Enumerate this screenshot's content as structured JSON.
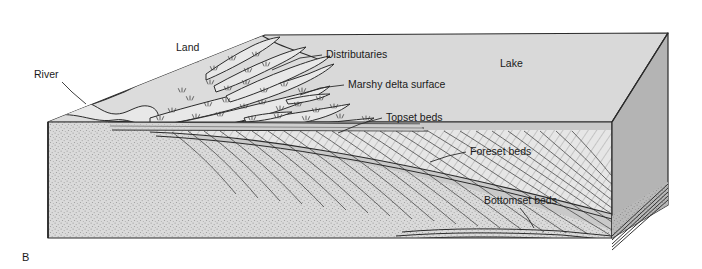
{
  "figure": {
    "panel_label": "B",
    "background_color": "#ffffff"
  },
  "palette": {
    "lake_surface": "#d9d9d9",
    "land_surface": "#dcdcdc",
    "right_face": "#b4b4b4",
    "front_face": "#c9c9c9",
    "left_face_stipple": "#d5d5d5",
    "foreset_fill": "#e2e2e2",
    "outline": "#2b2b2b",
    "text": "#1a1a1a"
  },
  "labels": [
    {
      "id": "river",
      "text": "River",
      "x": 34,
      "y": 78,
      "anchor": "start",
      "leader": [
        [
          62,
          82
        ],
        [
          72,
          92
        ],
        [
          86,
          104
        ]
      ]
    },
    {
      "id": "land",
      "text": "Land",
      "x": 176,
      "y": 51,
      "anchor": "start",
      "leader": []
    },
    {
      "id": "distributaries",
      "text": "Distributaries",
      "x": 326,
      "y": 58,
      "anchor": "start",
      "leader": [
        [
          322,
          55
        ],
        [
          300,
          58
        ],
        [
          272,
          70
        ]
      ]
    },
    {
      "id": "marshy",
      "text": "Marshy delta surface",
      "x": 348,
      "y": 88,
      "anchor": "start",
      "leader": [
        [
          344,
          85
        ],
        [
          320,
          88
        ],
        [
          300,
          95
        ]
      ]
    },
    {
      "id": "topset",
      "text": "Topset beds",
      "x": 386,
      "y": 121,
      "anchor": "start",
      "leader": [
        [
          382,
          118
        ],
        [
          360,
          124
        ],
        [
          338,
          133
        ]
      ]
    },
    {
      "id": "foreset",
      "text": "Foreset beds",
      "x": 470,
      "y": 155,
      "anchor": "start",
      "leader": [
        [
          466,
          152
        ],
        [
          448,
          156
        ],
        [
          430,
          162
        ]
      ]
    },
    {
      "id": "bottomset",
      "text": "Bottomset beds",
      "x": 484,
      "y": 204,
      "anchor": "start",
      "leader": [
        [
          520,
          208
        ],
        [
          528,
          218
        ],
        [
          534,
          226
        ]
      ]
    },
    {
      "id": "lake",
      "text": "Lake",
      "x": 500,
      "y": 67,
      "anchor": "start",
      "leader": []
    }
  ],
  "geometry": {
    "block_top_back_left": [
      265,
      35
    ],
    "block_top_back_right": [
      668,
      33
    ],
    "block_top_front_right": [
      612,
      122
    ],
    "block_front_left": [
      48,
      122
    ],
    "block_bottom_left": [
      48,
      238
    ],
    "block_bottom_front_right": [
      612,
      238
    ],
    "block_bottom_back_right": [
      668,
      205
    ]
  },
  "features": {
    "topset_bed_count": 3,
    "foreset_bed_count": 26,
    "bottomset_bed_count": 5,
    "distributary_channel_count": 14,
    "marsh_tuft_count": 34
  }
}
